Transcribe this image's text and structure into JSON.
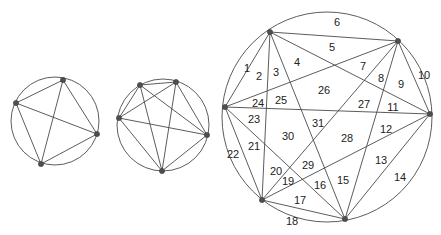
{
  "figure": {
    "background_color": "#ffffff",
    "line_color": "#4a4a4a",
    "vertex_color": "#4f4f4f",
    "label_color": "#222222"
  },
  "diagrams": [
    {
      "name": "diagram-4-points",
      "points": 4,
      "regions": 8,
      "circle": {
        "cx": 55,
        "cy": 121,
        "r": 44
      },
      "vertices": [
        {
          "id": "v1",
          "x": 63,
          "y": 80
        },
        {
          "id": "v2",
          "x": 16,
          "y": 103
        },
        {
          "id": "v3",
          "x": 97,
          "y": 134
        },
        {
          "id": "v4",
          "x": 41,
          "y": 164
        }
      ],
      "edges": [
        [
          "v1",
          "v2"
        ],
        [
          "v1",
          "v3"
        ],
        [
          "v1",
          "v4"
        ],
        [
          "v2",
          "v3"
        ],
        [
          "v2",
          "v4"
        ],
        [
          "v3",
          "v4"
        ]
      ]
    },
    {
      "name": "diagram-5-points",
      "points": 5,
      "regions": 16,
      "circle": {
        "cx": 163,
        "cy": 125,
        "r": 46
      },
      "vertices": [
        {
          "id": "w1",
          "x": 140,
          "y": 85
        },
        {
          "id": "w2",
          "x": 176,
          "y": 82
        },
        {
          "id": "w3",
          "x": 119,
          "y": 118
        },
        {
          "id": "w4",
          "x": 207,
          "y": 135
        },
        {
          "id": "w5",
          "x": 162,
          "y": 171
        }
      ],
      "edges": [
        [
          "w1",
          "w2"
        ],
        [
          "w1",
          "w3"
        ],
        [
          "w1",
          "w4"
        ],
        [
          "w1",
          "w5"
        ],
        [
          "w2",
          "w3"
        ],
        [
          "w2",
          "w4"
        ],
        [
          "w2",
          "w5"
        ],
        [
          "w3",
          "w4"
        ],
        [
          "w3",
          "w5"
        ],
        [
          "w4",
          "w5"
        ]
      ]
    },
    {
      "name": "diagram-6-points",
      "points": 6,
      "regions": 31,
      "circle": {
        "cx": 327,
        "cy": 117,
        "r": 105
      },
      "vertices": [
        {
          "id": "u1",
          "x": 270,
          "y": 32
        },
        {
          "id": "u2",
          "x": 398,
          "y": 41
        },
        {
          "id": "u3",
          "x": 225,
          "y": 107
        },
        {
          "id": "u4",
          "x": 430,
          "y": 114
        },
        {
          "id": "u5",
          "x": 262,
          "y": 200
        },
        {
          "id": "u6",
          "x": 345,
          "y": 219
        }
      ],
      "edges": [
        [
          "u1",
          "u2"
        ],
        [
          "u1",
          "u3"
        ],
        [
          "u1",
          "u4"
        ],
        [
          "u1",
          "u5"
        ],
        [
          "u1",
          "u6"
        ],
        [
          "u2",
          "u3"
        ],
        [
          "u2",
          "u4"
        ],
        [
          "u2",
          "u5"
        ],
        [
          "u2",
          "u6"
        ],
        [
          "u3",
          "u4"
        ],
        [
          "u3",
          "u5"
        ],
        [
          "u3",
          "u6"
        ],
        [
          "u4",
          "u5"
        ],
        [
          "u4",
          "u6"
        ],
        [
          "u5",
          "u6"
        ]
      ],
      "region_labels": [
        {
          "n": "1",
          "x": 247,
          "y": 69
        },
        {
          "n": "2",
          "x": 259,
          "y": 77
        },
        {
          "n": "3",
          "x": 276,
          "y": 73
        },
        {
          "n": "4",
          "x": 297,
          "y": 63
        },
        {
          "n": "5",
          "x": 332,
          "y": 48
        },
        {
          "n": "6",
          "x": 337,
          "y": 23
        },
        {
          "n": "7",
          "x": 363,
          "y": 67
        },
        {
          "n": "8",
          "x": 381,
          "y": 79
        },
        {
          "n": "9",
          "x": 401,
          "y": 85
        },
        {
          "n": "10",
          "x": 424,
          "y": 76
        },
        {
          "n": "11",
          "x": 393,
          "y": 108
        },
        {
          "n": "12",
          "x": 386,
          "y": 130
        },
        {
          "n": "13",
          "x": 381,
          "y": 161
        },
        {
          "n": "14",
          "x": 400,
          "y": 178
        },
        {
          "n": "15",
          "x": 343,
          "y": 181
        },
        {
          "n": "16",
          "x": 320,
          "y": 186
        },
        {
          "n": "17",
          "x": 300,
          "y": 201
        },
        {
          "n": "18",
          "x": 292,
          "y": 222
        },
        {
          "n": "19",
          "x": 288,
          "y": 182
        },
        {
          "n": "20",
          "x": 276,
          "y": 172
        },
        {
          "n": "21",
          "x": 254,
          "y": 147
        },
        {
          "n": "22",
          "x": 233,
          "y": 155
        },
        {
          "n": "23",
          "x": 254,
          "y": 120
        },
        {
          "n": "24",
          "x": 258,
          "y": 104
        },
        {
          "n": "25",
          "x": 281,
          "y": 101
        },
        {
          "n": "26",
          "x": 324,
          "y": 91
        },
        {
          "n": "27",
          "x": 364,
          "y": 105
        },
        {
          "n": "28",
          "x": 347,
          "y": 139
        },
        {
          "n": "29",
          "x": 308,
          "y": 166
        },
        {
          "n": "30",
          "x": 288,
          "y": 137
        },
        {
          "n": "31",
          "x": 318,
          "y": 124
        }
      ]
    }
  ]
}
